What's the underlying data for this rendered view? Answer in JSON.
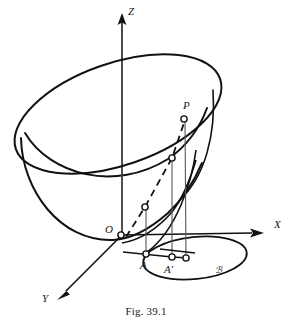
{
  "figure": {
    "caption": "Fig. 39.1",
    "stroke_color": "#111111",
    "thin_stroke_color": "#555555",
    "background": "#ffffff"
  },
  "axes": [
    {
      "id": "z",
      "label": "Z",
      "label_x": 128,
      "label_y": 6,
      "direction": "up"
    },
    {
      "id": "x",
      "label": "X",
      "label_x": 274,
      "label_y": 219,
      "direction": "right"
    },
    {
      "id": "y",
      "label": "Y",
      "label_x": 42,
      "label_y": 293,
      "direction": "down-left"
    }
  ],
  "points": [
    {
      "id": "O",
      "label": "O",
      "label_x": 105,
      "label_y": 224,
      "marker_x": 121,
      "marker_y": 235,
      "marker": true
    },
    {
      "id": "P",
      "label": "P",
      "label_x": 183,
      "label_y": 100,
      "marker_x": 184,
      "marker_y": 119,
      "marker": true
    },
    {
      "id": "M2",
      "label": "",
      "label_x": 0,
      "label_y": 0,
      "marker_x": 172,
      "marker_y": 158,
      "marker": true
    },
    {
      "id": "M1",
      "label": "",
      "label_x": 0,
      "label_y": 0,
      "marker_x": 145,
      "marker_y": 207,
      "marker": true
    },
    {
      "id": "A",
      "label": "A",
      "label_x": 140,
      "label_y": 260,
      "marker_x": 146,
      "marker_y": 254,
      "marker": true
    },
    {
      "id": "Aprime",
      "label": "A'",
      "label_x": 164,
      "label_y": 264,
      "marker_x": 172,
      "marker_y": 257,
      "marker": true
    },
    {
      "id": "Pbase",
      "label": "",
      "label_x": 0,
      "label_y": 0,
      "marker_x": 186,
      "marker_y": 258,
      "marker": true
    }
  ],
  "curves": [
    {
      "id": "ellipse-base",
      "label": "ℬ",
      "label_x": 215,
      "label_y": 266,
      "style": "solid"
    }
  ],
  "line_styles": {
    "surface": "solid",
    "generator_dashed": "dashed",
    "generator_solid": "solid",
    "projector": "thin-solid"
  }
}
